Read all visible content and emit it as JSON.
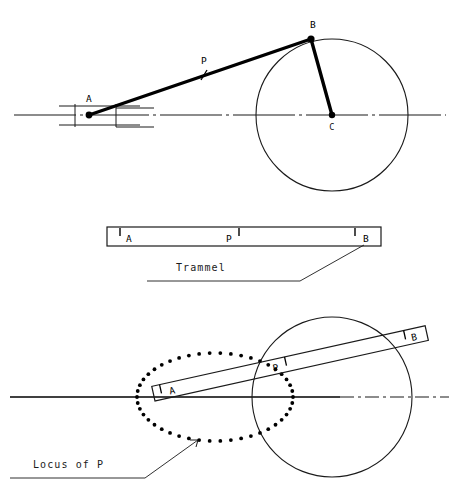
{
  "figure": {
    "background_color": "#ffffff",
    "ink_color": "#000000",
    "line_color": "#1a1a1a"
  },
  "top_diagram": {
    "name": "crank-and-slider-linkage",
    "labels": {
      "point_a": "A",
      "point_p": "P",
      "point_b": "B",
      "center_c": "C"
    },
    "geometry": {
      "centerline_y": 115,
      "centerline_x_start": 14,
      "centerline_x_end": 446,
      "circle_center_x": 332,
      "circle_center_y": 115,
      "circle_radius": 76,
      "point_a_x": 89,
      "point_a_y": 115,
      "point_b_x": 311,
      "point_b_y": 39,
      "point_p_x": 204,
      "point_p_y": 75,
      "slider_left_x": 59,
      "slider_right_x": 140,
      "slider_rail_top_y": 106,
      "slider_rail_bottom_y": 125,
      "slider_box_left_x": 75,
      "slider_box_right_x": 116,
      "link_width": 3.2
    }
  },
  "trammel_diagram": {
    "name": "trammel-bar",
    "labels": {
      "point_a": "A",
      "point_p": "P",
      "point_b": "B"
    },
    "caption": "Trammel",
    "geometry": {
      "bar_left_x": 107,
      "bar_right_x": 381,
      "bar_top_y": 227,
      "bar_bottom_y": 246,
      "tick_a_x": 120,
      "tick_p_x": 239,
      "tick_b_x": 355,
      "caption_x": 176,
      "caption_y": 271,
      "leader_underline_y": 281,
      "leader_underline_x_start": 147,
      "leader_underline_x_end": 300,
      "leader_elbow_x": 300,
      "leader_tip_x": 364,
      "leader_tip_y": 245
    }
  },
  "locus_diagram": {
    "name": "locus-of-p-construction",
    "labels": {
      "point_a": "A",
      "point_p": "P",
      "point_b": "B"
    },
    "caption": "Locus of P",
    "geometry": {
      "centerline_y": 397,
      "centerline_x_start": 10,
      "centerline_x_end": 449,
      "circle_center_x": 332,
      "circle_center_y": 397,
      "circle_radius": 80,
      "ellipse_center_x": 215,
      "ellipse_center_y": 397,
      "ellipse_rx": 78,
      "ellipse_ry": 44,
      "ellipse_dot_count": 46,
      "ellipse_dot_radius": 1.9,
      "bar_angle_deg": -12.5,
      "bar_a_x": 155,
      "bar_a_y": 401,
      "bar_b_x": 428,
      "bar_b_y": 341,
      "bar_thickness": 15,
      "tick_a_offset": 8,
      "tick_p_offset": 136,
      "tick_b_offset": 258,
      "caption_x": 33,
      "caption_y": 468,
      "leader_underline_y": 478,
      "leader_underline_x_start": 10,
      "leader_underline_x_end": 145,
      "leader_elbow_x": 145,
      "leader_tip_x": 198,
      "leader_tip_y": 440
    }
  }
}
